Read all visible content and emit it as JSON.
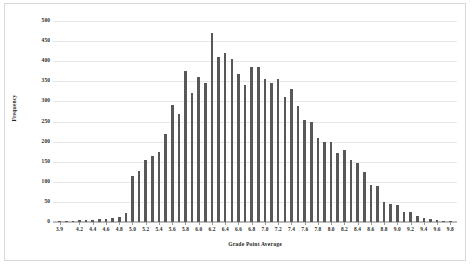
{
  "figure": {
    "background_color": "#ffffff",
    "frame_color": "#d9d9d9",
    "bar_color": "#585858",
    "gridline_color": "#e8e8e8"
  },
  "chart_data": {
    "type": "bar",
    "title": "",
    "subtitle": "",
    "xlabel": "Grade Point Average",
    "ylabel": "Frequency",
    "xlim": [
      3.8,
      9.9
    ],
    "ylim": [
      0,
      500
    ],
    "ytick_values": [
      0,
      50,
      100,
      150,
      200,
      250,
      300,
      350,
      400,
      450,
      500
    ],
    "ytick_labels": [
      "0",
      "50",
      "100",
      "150",
      "200",
      "250",
      "300",
      "350",
      "400",
      "450",
      "500"
    ],
    "xtick_labels": [
      "3.9",
      "4.2",
      "4.4",
      "4.6",
      "4.8",
      "5.0",
      "5.2",
      "5.4",
      "5.6",
      "5.8",
      "6.0",
      "6.2",
      "6.4",
      "6.6",
      "6.8",
      "7.0",
      "7.2",
      "7.4",
      "7.6",
      "7.8",
      "8.0",
      "8.2",
      "8.4",
      "8.6",
      "8.8",
      "9.0",
      "9.2",
      "9.4",
      "9.6",
      "9.8"
    ],
    "xtick_positions": [
      3.9,
      4.2,
      4.4,
      4.6,
      4.8,
      5.0,
      5.2,
      5.4,
      5.6,
      5.8,
      6.0,
      6.2,
      6.4,
      6.6,
      6.8,
      7.0,
      7.2,
      7.4,
      7.6,
      7.8,
      8.0,
      8.2,
      8.4,
      8.6,
      8.8,
      9.0,
      9.2,
      9.4,
      9.6,
      9.8
    ],
    "grid": true,
    "grid_axis": "y",
    "legend": false,
    "legend_position": "none",
    "categories": [
      3.9,
      4.0,
      4.1,
      4.2,
      4.3,
      4.4,
      4.5,
      4.6,
      4.7,
      4.8,
      4.9,
      5.0,
      5.1,
      5.2,
      5.3,
      5.4,
      5.5,
      5.6,
      5.7,
      5.8,
      5.9,
      6.0,
      6.1,
      6.2,
      6.3,
      6.4,
      6.5,
      6.6,
      6.7,
      6.8,
      6.9,
      7.0,
      7.1,
      7.2,
      7.3,
      7.4,
      7.5,
      7.6,
      7.7,
      7.8,
      7.9,
      8.0,
      8.1,
      8.2,
      8.3,
      8.4,
      8.5,
      8.6,
      8.7,
      8.8,
      8.9,
      9.0,
      9.1,
      9.2,
      9.3,
      9.4,
      9.5,
      9.6,
      9.7,
      9.8
    ],
    "values": [
      2,
      3,
      3,
      4,
      5,
      6,
      8,
      7,
      10,
      12,
      22,
      115,
      128,
      155,
      165,
      175,
      218,
      292,
      268,
      375,
      322,
      360,
      345,
      470,
      410,
      420,
      405,
      368,
      340,
      385,
      385,
      355,
      345,
      355,
      310,
      332,
      288,
      255,
      248,
      210,
      198,
      200,
      172,
      178,
      155,
      148,
      125,
      93,
      90,
      50,
      46,
      42,
      25,
      24,
      15,
      10,
      7,
      5,
      3,
      2
    ]
  },
  "yaxis": {
    "title": "Frequency"
  },
  "xaxis": {
    "title": "Grade Point Average"
  }
}
